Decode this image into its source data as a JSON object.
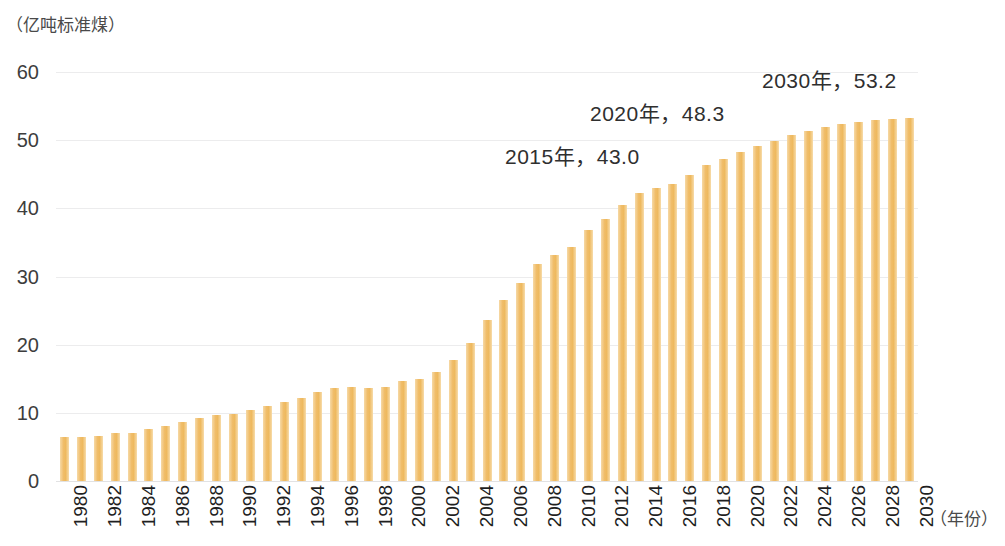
{
  "chart_data": {
    "type": "bar",
    "title": "",
    "subtitle": "",
    "xlabel": "（年份）",
    "ylabel": "（亿吨标准煤）",
    "ylim": [
      0,
      60
    ],
    "yticks": [
      0,
      10,
      20,
      30,
      40,
      50,
      60
    ],
    "ytick_labels": [
      "0",
      "10",
      "20",
      "30",
      "40",
      "50",
      "60"
    ],
    "grid": true,
    "legend": null,
    "legend_position": "none",
    "bar_color": "#F0BD6A",
    "background_color": "#FFFFFF",
    "gridline_color": "#ECECED",
    "categories": [
      "1980",
      "1981",
      "1982",
      "1983",
      "1984",
      "1985",
      "1986",
      "1987",
      "1988",
      "1989",
      "1990",
      "1991",
      "1992",
      "1993",
      "1994",
      "1995",
      "1996",
      "1997",
      "1998",
      "1999",
      "2000",
      "2001",
      "2002",
      "2003",
      "2004",
      "2005",
      "2006",
      "2007",
      "2008",
      "2009",
      "2010",
      "2011",
      "2012",
      "2013",
      "2014",
      "2015",
      "2016",
      "2017",
      "2018",
      "2019",
      "2020",
      "2021",
      "2022",
      "2023",
      "2024",
      "2025",
      "2026",
      "2027",
      "2028",
      "2029",
      "2030"
    ],
    "values": [
      6.4,
      6.4,
      6.6,
      7.1,
      7.1,
      7.7,
      8.1,
      8.7,
      9.3,
      9.7,
      9.9,
      10.4,
      11.0,
      11.6,
      12.2,
      13.1,
      13.6,
      13.8,
      13.6,
      13.8,
      14.6,
      15.0,
      16.0,
      17.8,
      20.3,
      23.6,
      26.6,
      29.1,
      31.9,
      33.1,
      34.3,
      36.8,
      38.5,
      40.5,
      42.3,
      43.0,
      43.6,
      44.9,
      46.4,
      47.2,
      48.3,
      49.2,
      49.9,
      50.8,
      51.4,
      52.0,
      52.4,
      52.6,
      52.9,
      53.1,
      53.2
    ],
    "annotations": [
      {
        "label": "2015年，43.0",
        "year": "2015",
        "value": 43.0
      },
      {
        "label": "2020年，48.3",
        "year": "2020",
        "value": 48.3
      },
      {
        "label": "2030年，53.2",
        "year": "2030",
        "value": 53.2
      }
    ],
    "xtick_labels": [
      "1980",
      "1982",
      "1984",
      "1986",
      "1988",
      "1990",
      "1992",
      "1994",
      "1996",
      "1998",
      "2000",
      "2002",
      "2004",
      "2006",
      "2008",
      "2010",
      "2012",
      "2014",
      "2016",
      "2018",
      "2020",
      "2022",
      "2024",
      "2026",
      "2028",
      "2030"
    ]
  }
}
